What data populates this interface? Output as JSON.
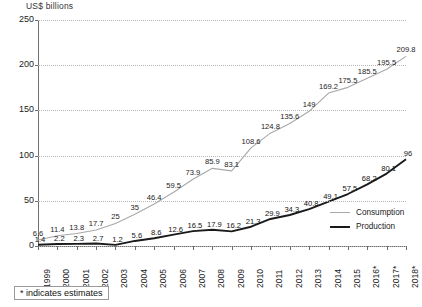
{
  "chart_data": {
    "type": "line",
    "title": "",
    "ylabel": "US$ billions",
    "xlabel": "",
    "ylim": [
      0,
      250
    ],
    "yticks": [
      0,
      50,
      100,
      150,
      200,
      250
    ],
    "grid": true,
    "legend_position": "bottom-right",
    "categories": [
      "1999",
      "2000",
      "2001",
      "2002",
      "2003",
      "2004",
      "2005",
      "2006",
      "2007",
      "2008",
      "2009",
      "2010",
      "2011",
      "2012",
      "2013",
      "2014",
      "2015",
      "2016*",
      "2017*",
      "2018*"
    ],
    "series": [
      {
        "name": "Consumption",
        "color": "#a8a8a8",
        "values": [
          6.6,
          11.4,
          13.8,
          17.7,
          25,
          35,
          46.4,
          59.5,
          73.9,
          85.9,
          83.1,
          108.6,
          124.8,
          135.6,
          149,
          169.2,
          175.5,
          185.5,
          195.5,
          209.8
        ],
        "labels": [
          "6.6",
          "11.4",
          "13.8",
          "17.7",
          "25",
          "35",
          "46.4",
          "59.5",
          "73.9",
          "85.9",
          "83.1",
          "108.6",
          "124.8",
          "135.6",
          "149",
          "169.2",
          "175.5",
          "185.5",
          "195.5",
          "209.8"
        ]
      },
      {
        "name": "Production",
        "color": "#1a1a1a",
        "values": [
          1.4,
          2.2,
          2.3,
          2.7,
          1.2,
          5.6,
          8.6,
          12.6,
          16.5,
          17.9,
          16.2,
          21.3,
          29.9,
          34.3,
          40.8,
          49.1,
          57.5,
          68.2,
          80.1,
          96
        ],
        "labels": [
          "1.4",
          "2.2",
          "2.3",
          "2.7",
          "1.2",
          "5.6",
          "8.6",
          "12.6",
          "16.5",
          "17.9",
          "16.2",
          "21.3",
          "29.9",
          "34.3",
          "40.8",
          "49.1",
          "57.5",
          "68.2",
          "80.1",
          "96"
        ]
      }
    ],
    "footnote": "* indicates estimates"
  }
}
